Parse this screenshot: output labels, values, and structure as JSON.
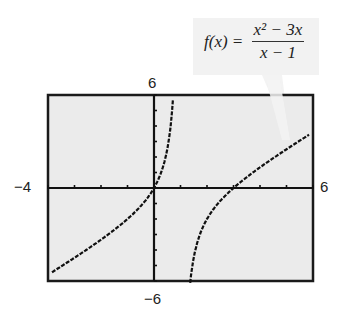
{
  "chart_data": {
    "type": "line",
    "title": "",
    "function_label": "f(x) = (x^2 - 3x)/(x - 1)",
    "formula": {
      "lhs": "f(x) =",
      "numerator": "x² − 3x",
      "denominator": "x − 1"
    },
    "xlabel": "",
    "ylabel": "",
    "xlim": [
      -4,
      6
    ],
    "ylim": [
      -6,
      6
    ],
    "window_labels": {
      "xmin": "−4",
      "xmax": "6",
      "ymin": "−6",
      "ymax": "6"
    },
    "x_ticks": [
      -4,
      -3,
      -2,
      -1,
      0,
      1,
      2,
      3,
      4,
      5,
      6
    ],
    "y_ticks": [
      -6,
      -5,
      -4,
      -3,
      -2,
      -1,
      0,
      1,
      2,
      3,
      4,
      5,
      6
    ],
    "grid": false,
    "vertical_asymptote": 1,
    "zeros": [
      0,
      3
    ],
    "series": [
      {
        "name": "f(x) left branch",
        "x": [
          -3.8,
          -3,
          -2,
          -1,
          -0.5,
          0,
          0.3,
          0.5,
          0.7,
          0.8,
          0.85
        ],
        "y": [
          -4.1,
          -3.38,
          -2.33,
          -1.0,
          0.17,
          0,
          0.9,
          2.5,
          5.8,
          8.8,
          10.7
        ]
      },
      {
        "name": "f(x) right branch",
        "x": [
          1.25,
          1.5,
          2,
          2.5,
          3,
          4,
          5,
          5.8
        ],
        "y": [
          -6.75,
          -4.5,
          -2,
          -0.83,
          0,
          1.33,
          2.5,
          3.58
        ]
      }
    ],
    "colors": {
      "curve": "#111111",
      "axes": "#111111",
      "frame": "#1a1a1a",
      "plot_bg": "#ebebeb",
      "callout_bg": "#f2f2f2"
    }
  }
}
